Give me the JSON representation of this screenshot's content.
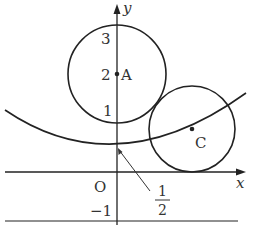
{
  "figure": {
    "axes": {
      "x_label": "x",
      "y_label": "y",
      "origin_label": "O"
    },
    "y_ticks": [
      "3",
      "2",
      "1",
      "−1"
    ],
    "points": [
      {
        "name": "A",
        "label": "A",
        "coords": [
          0,
          2
        ]
      },
      {
        "name": "C",
        "label": "C"
      }
    ],
    "circles": [
      {
        "name": "circle-A",
        "center": "A",
        "radius": 1
      },
      {
        "name": "circle-C",
        "center": "C",
        "tangent_to": "x-axis"
      }
    ],
    "curve": {
      "name": "parabola",
      "vertex_y_label_num": "1",
      "vertex_y_label_den": "2"
    },
    "colors": {
      "stroke": "#222222",
      "text": "#333333"
    }
  }
}
